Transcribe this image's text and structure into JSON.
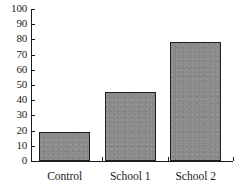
{
  "chart_data": {
    "type": "bar",
    "title": "",
    "xlabel": "",
    "ylabel": "",
    "categories": [
      "Control",
      "School 1",
      "School 2"
    ],
    "values": [
      19,
      45.5,
      78
    ],
    "ylim": [
      0,
      100
    ],
    "ytick_labels": [
      "100",
      "90",
      "80",
      "70",
      "60",
      "50",
      "40",
      "30",
      "20",
      "10",
      "0"
    ],
    "ytick_values": [
      100,
      90,
      80,
      70,
      60,
      50,
      40,
      30,
      20,
      10,
      0
    ],
    "grid": false,
    "legend": null,
    "bar_color": "#8a8a8a",
    "bar_border_color": "#1f1f1f",
    "axis_color": "#1a1a1a"
  }
}
